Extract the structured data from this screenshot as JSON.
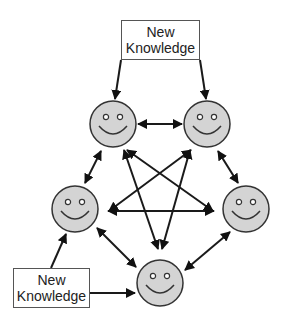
{
  "diagram": {
    "top_box": {
      "line1": "New",
      "line2": "Knowledge"
    },
    "bottom_box": {
      "line1": "New",
      "line2": "Knowledge"
    },
    "nodes": [
      {
        "id": "top-left",
        "type": "smiley"
      },
      {
        "id": "top-right",
        "type": "smiley"
      },
      {
        "id": "left",
        "type": "smiley"
      },
      {
        "id": "right",
        "type": "smiley"
      },
      {
        "id": "bottom",
        "type": "smiley"
      }
    ],
    "edges": [
      {
        "from": "top-box",
        "to": "top-left",
        "direction": "one-way"
      },
      {
        "from": "top-box",
        "to": "top-right",
        "direction": "one-way"
      },
      {
        "from": "bottom-box",
        "to": "left",
        "direction": "one-way"
      },
      {
        "from": "bottom-box",
        "to": "bottom",
        "direction": "one-way"
      },
      {
        "from": "top-left",
        "to": "top-right",
        "direction": "two-way"
      },
      {
        "from": "top-left",
        "to": "left",
        "direction": "two-way"
      },
      {
        "from": "top-right",
        "to": "right",
        "direction": "two-way"
      },
      {
        "from": "left",
        "to": "bottom",
        "direction": "two-way"
      },
      {
        "from": "right",
        "to": "bottom",
        "direction": "two-way"
      },
      {
        "from": "left",
        "to": "right",
        "direction": "two-way"
      },
      {
        "from": "top-left",
        "to": "bottom",
        "direction": "two-way"
      },
      {
        "from": "top-right",
        "to": "bottom",
        "direction": "two-way"
      },
      {
        "from": "top-left",
        "to": "right",
        "direction": "two-way"
      },
      {
        "from": "top-right",
        "to": "left",
        "direction": "two-way"
      }
    ],
    "colors": {
      "face_fill": "#d4d4d4",
      "stroke": "#222222"
    }
  }
}
